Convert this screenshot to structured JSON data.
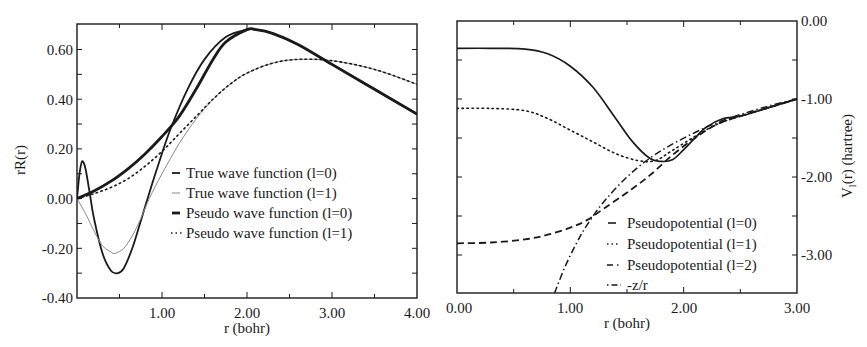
{
  "chart_data": [
    {
      "type": "line",
      "title": "",
      "xlabel": "r (bohr)",
      "ylabel": "rR(r)",
      "xlim": [
        0,
        4.0
      ],
      "ylim": [
        -0.4,
        0.7
      ],
      "xticks": [
        "1.00",
        "2.00",
        "3.00",
        "4.00"
      ],
      "yticks": [
        "0.60",
        "0.40",
        "0.20",
        "0.00",
        "-0.20",
        "-0.40"
      ],
      "grid": false,
      "legend_position": "center-right",
      "series": [
        {
          "name": "True wave function (l=0)",
          "style": "solid-medium",
          "x": [
            0,
            0.03,
            0.06,
            0.1,
            0.15,
            0.2,
            0.3,
            0.4,
            0.48,
            0.55,
            0.65,
            0.75,
            0.83,
            0.95,
            1.1,
            1.3,
            1.5,
            1.75,
            2.0,
            2.1,
            2.3,
            2.6,
            3.0,
            3.5,
            4.0
          ],
          "y": [
            0,
            0.1,
            0.15,
            0.12,
            0.02,
            -0.08,
            -0.22,
            -0.29,
            -0.3,
            -0.28,
            -0.2,
            -0.09,
            0.0,
            0.13,
            0.28,
            0.44,
            0.56,
            0.65,
            0.68,
            0.68,
            0.665,
            0.62,
            0.54,
            0.44,
            0.34
          ]
        },
        {
          "name": "True wave function (l=1)",
          "style": "solid-thin-gray",
          "x": [
            0,
            0.1,
            0.2,
            0.3,
            0.4,
            0.45,
            0.55,
            0.65,
            0.75,
            0.85,
            1.0,
            1.2,
            1.4,
            1.6,
            1.8,
            2.0,
            2.3,
            2.6,
            3.0,
            3.5,
            4.0
          ],
          "y": [
            0,
            -0.06,
            -0.13,
            -0.19,
            -0.215,
            -0.22,
            -0.2,
            -0.15,
            -0.08,
            0.0,
            0.1,
            0.22,
            0.32,
            0.4,
            0.46,
            0.505,
            0.545,
            0.56,
            0.555,
            0.52,
            0.46
          ]
        },
        {
          "name": "Pseudo wave function (l=0)",
          "style": "solid-thick",
          "x": [
            0,
            0.2,
            0.4,
            0.6,
            0.8,
            1.0,
            1.2,
            1.4,
            1.6,
            1.75,
            2.0,
            2.1,
            2.3,
            2.6,
            3.0,
            3.5,
            4.0
          ],
          "y": [
            0,
            0.03,
            0.07,
            0.12,
            0.18,
            0.25,
            0.33,
            0.44,
            0.56,
            0.63,
            0.68,
            0.68,
            0.665,
            0.62,
            0.54,
            0.44,
            0.34
          ]
        },
        {
          "name": "Pseudo wave function (l=1)",
          "style": "dotted",
          "x": [
            0,
            0.2,
            0.4,
            0.6,
            0.8,
            1.0,
            1.2,
            1.4,
            1.6,
            1.8,
            2.0,
            2.3,
            2.6,
            3.0,
            3.5,
            4.0
          ],
          "y": [
            0,
            0.02,
            0.045,
            0.08,
            0.13,
            0.19,
            0.26,
            0.33,
            0.4,
            0.46,
            0.505,
            0.545,
            0.56,
            0.555,
            0.52,
            0.46
          ]
        }
      ]
    },
    {
      "type": "line",
      "title": "",
      "xlabel": "r (bohr)",
      "ylabel": "V_l(r) (hartree)",
      "xlim": [
        0,
        3.0
      ],
      "ylim": [
        -3.49,
        0.0
      ],
      "xticks": [
        "0.00",
        "1.00",
        "2.00",
        "3.00"
      ],
      "yticks": [
        "0.00",
        "-1.00",
        "-2.00",
        "-3.00"
      ],
      "y_axis_side": "right",
      "grid": false,
      "legend_position": "lower-right",
      "series": [
        {
          "name": "Pseudopotential (l=0)",
          "style": "solid",
          "x": [
            0,
            0.3,
            0.6,
            0.8,
            1.0,
            1.2,
            1.4,
            1.55,
            1.7,
            1.8,
            1.9,
            2.0,
            2.1,
            2.2,
            2.35,
            2.5,
            2.75,
            3.0
          ],
          "y": [
            -0.35,
            -0.35,
            -0.36,
            -0.42,
            -0.58,
            -0.85,
            -1.25,
            -1.55,
            -1.76,
            -1.8,
            -1.78,
            -1.65,
            -1.5,
            -1.36,
            -1.25,
            -1.22,
            -1.11,
            -1.0
          ]
        },
        {
          "name": "Pseudopotential (l=1)",
          "style": "dotted",
          "x": [
            0,
            0.3,
            0.6,
            0.8,
            1.0,
            1.2,
            1.4,
            1.6,
            1.75,
            1.9,
            2.1,
            2.3,
            2.5,
            2.75,
            3.0
          ],
          "y": [
            -1.12,
            -1.12,
            -1.15,
            -1.25,
            -1.4,
            -1.55,
            -1.7,
            -1.79,
            -1.79,
            -1.66,
            -1.48,
            -1.32,
            -1.22,
            -1.11,
            -1.0
          ]
        },
        {
          "name": "Pseudopotential (l=2)",
          "style": "dashed",
          "x": [
            0,
            0.3,
            0.6,
            0.8,
            1.0,
            1.15,
            1.3,
            1.5,
            1.7,
            1.9,
            2.1,
            2.3,
            2.5,
            2.75,
            3.0
          ],
          "y": [
            -2.85,
            -2.84,
            -2.8,
            -2.74,
            -2.65,
            -2.55,
            -2.4,
            -2.2,
            -1.98,
            -1.72,
            -1.5,
            -1.32,
            -1.22,
            -1.11,
            -1.0
          ]
        },
        {
          "name": "-z/r",
          "style": "dash-dot",
          "x": [
            0.86,
            0.95,
            1.05,
            1.15,
            1.3,
            1.5,
            1.7,
            1.9,
            2.1,
            2.3,
            2.5,
            2.75,
            3.0
          ],
          "y": [
            -3.49,
            -3.16,
            -2.86,
            -2.61,
            -2.31,
            -2.0,
            -1.76,
            -1.58,
            -1.43,
            -1.3,
            -1.2,
            -1.09,
            -1.0
          ]
        }
      ]
    }
  ],
  "left_plot": {
    "ylabel": "rR(r)",
    "xlabel": "r (bohr)",
    "xticks": [
      "1.00",
      "2.00",
      "3.00",
      "4.00"
    ],
    "yticks": [
      "0.60",
      "0.40",
      "0.20",
      "0.00",
      "-0.20",
      "-0.40"
    ],
    "legend": [
      {
        "label": "True wave function (l=0)"
      },
      {
        "label": "True wave function (l=1)"
      },
      {
        "label": "Pseudo wave function (l=0)"
      },
      {
        "label": "Pseudo wave function (l=1)"
      }
    ]
  },
  "right_plot": {
    "ylabel": "V",
    "ylabel_sub": "l",
    "ylabel_rest": "(r) (hartree)",
    "xlabel": "r (bohr)",
    "xticks": [
      "0.00",
      "1.00",
      "2.00",
      "3.00"
    ],
    "yticks": [
      "0.00",
      "-1.00",
      "-2.00",
      "-3.00"
    ],
    "legend": [
      {
        "label": "Pseudopotential (l=0)"
      },
      {
        "label": "Pseudopotential (l=1)"
      },
      {
        "label": "Pseudopotential (l=2)"
      },
      {
        "label": "-z/r"
      }
    ]
  },
  "colors": {
    "ink": "#1a1a1a",
    "gray_line": "#8a8a8a",
    "background": "#ffffff"
  }
}
